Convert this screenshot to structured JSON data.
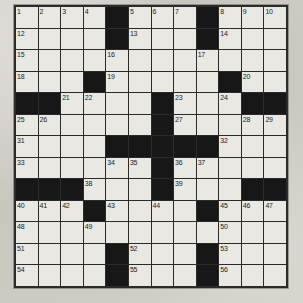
{
  "document": {
    "type": "crossword-puzzle-grid",
    "title": "Crossword Puzzle",
    "grid": {
      "columns": 12,
      "rows": 13,
      "total_cells": 156,
      "highest_clue_number": 56
    },
    "colors": {
      "paper_background": "#cfcbc3",
      "open_cell": "#e9e8e3",
      "block_cell": "#171717",
      "grid_line": "#2b2b2b",
      "number_text": "#1b1b1b"
    },
    "cells": [
      [
        {
          "block": false,
          "num": "1"
        },
        {
          "block": false,
          "num": "2"
        },
        {
          "block": false,
          "num": "3"
        },
        {
          "block": false,
          "num": "4"
        },
        {
          "block": true,
          "num": ""
        },
        {
          "block": false,
          "num": "5"
        },
        {
          "block": false,
          "num": "6"
        },
        {
          "block": false,
          "num": "7"
        },
        {
          "block": true,
          "num": ""
        },
        {
          "block": false,
          "num": "8"
        },
        {
          "block": false,
          "num": "9"
        },
        {
          "block": false,
          "num": "10"
        },
        {
          "block": false,
          "num": "11"
        }
      ],
      [
        {
          "block": false,
          "num": "12"
        },
        {
          "block": false,
          "num": ""
        },
        {
          "block": false,
          "num": ""
        },
        {
          "block": false,
          "num": ""
        },
        {
          "block": true,
          "num": ""
        },
        {
          "block": false,
          "num": "13"
        },
        {
          "block": false,
          "num": ""
        },
        {
          "block": false,
          "num": ""
        },
        {
          "block": true,
          "num": ""
        },
        {
          "block": false,
          "num": "14"
        },
        {
          "block": false,
          "num": ""
        },
        {
          "block": false,
          "num": ""
        }
      ],
      [
        {
          "block": false,
          "num": "15"
        },
        {
          "block": false,
          "num": ""
        },
        {
          "block": false,
          "num": ""
        },
        {
          "block": false,
          "num": ""
        },
        {
          "block": false,
          "num": "16"
        },
        {
          "block": false,
          "num": ""
        },
        {
          "block": false,
          "num": ""
        },
        {
          "block": false,
          "num": ""
        },
        {
          "block": false,
          "num": "17"
        },
        {
          "block": false,
          "num": ""
        },
        {
          "block": false,
          "num": ""
        },
        {
          "block": false,
          "num": ""
        }
      ],
      [
        {
          "block": false,
          "num": "18"
        },
        {
          "block": false,
          "num": ""
        },
        {
          "block": false,
          "num": ""
        },
        {
          "block": true,
          "num": ""
        },
        {
          "block": false,
          "num": "19"
        },
        {
          "block": false,
          "num": ""
        },
        {
          "block": false,
          "num": ""
        },
        {
          "block": false,
          "num": ""
        },
        {
          "block": false,
          "num": ""
        },
        {
          "block": true,
          "num": ""
        },
        {
          "block": false,
          "num": "20"
        },
        {
          "block": false,
          "num": ""
        },
        {
          "block": false,
          "num": ""
        }
      ],
      [
        {
          "block": true,
          "num": ""
        },
        {
          "block": true,
          "num": ""
        },
        {
          "block": false,
          "num": "21"
        },
        {
          "block": false,
          "num": "22"
        },
        {
          "block": false,
          "num": ""
        },
        {
          "block": false,
          "num": ""
        },
        {
          "block": true,
          "num": ""
        },
        {
          "block": false,
          "num": "23"
        },
        {
          "block": false,
          "num": ""
        },
        {
          "block": false,
          "num": "24"
        },
        {
          "block": true,
          "num": ""
        },
        {
          "block": true,
          "num": ""
        }
      ],
      [
        {
          "block": false,
          "num": "25"
        },
        {
          "block": false,
          "num": "26"
        },
        {
          "block": false,
          "num": ""
        },
        {
          "block": false,
          "num": ""
        },
        {
          "block": false,
          "num": ""
        },
        {
          "block": false,
          "num": ""
        },
        {
          "block": true,
          "num": ""
        },
        {
          "block": false,
          "num": "27"
        },
        {
          "block": false,
          "num": ""
        },
        {
          "block": false,
          "num": ""
        },
        {
          "block": false,
          "num": "28"
        },
        {
          "block": false,
          "num": "29"
        },
        {
          "block": false,
          "num": "30"
        }
      ],
      [
        {
          "block": false,
          "num": "31"
        },
        {
          "block": false,
          "num": ""
        },
        {
          "block": false,
          "num": ""
        },
        {
          "block": false,
          "num": ""
        },
        {
          "block": true,
          "num": ""
        },
        {
          "block": true,
          "num": ""
        },
        {
          "block": true,
          "num": ""
        },
        {
          "block": true,
          "num": ""
        },
        {
          "block": true,
          "num": ""
        },
        {
          "block": false,
          "num": "32"
        },
        {
          "block": false,
          "num": ""
        },
        {
          "block": false,
          "num": ""
        }
      ],
      [
        {
          "block": false,
          "num": "33"
        },
        {
          "block": false,
          "num": ""
        },
        {
          "block": false,
          "num": ""
        },
        {
          "block": false,
          "num": ""
        },
        {
          "block": false,
          "num": "34"
        },
        {
          "block": false,
          "num": "35"
        },
        {
          "block": true,
          "num": ""
        },
        {
          "block": false,
          "num": "36"
        },
        {
          "block": false,
          "num": "37"
        },
        {
          "block": false,
          "num": ""
        },
        {
          "block": false,
          "num": ""
        },
        {
          "block": false,
          "num": ""
        }
      ],
      [
        {
          "block": true,
          "num": ""
        },
        {
          "block": true,
          "num": ""
        },
        {
          "block": true,
          "num": ""
        },
        {
          "block": false,
          "num": "38"
        },
        {
          "block": false,
          "num": ""
        },
        {
          "block": false,
          "num": ""
        },
        {
          "block": true,
          "num": ""
        },
        {
          "block": false,
          "num": "39"
        },
        {
          "block": false,
          "num": ""
        },
        {
          "block": false,
          "num": ""
        },
        {
          "block": true,
          "num": ""
        },
        {
          "block": true,
          "num": ""
        }
      ],
      [
        {
          "block": false,
          "num": "40"
        },
        {
          "block": false,
          "num": "41"
        },
        {
          "block": false,
          "num": "42"
        },
        {
          "block": true,
          "num": ""
        },
        {
          "block": false,
          "num": "43"
        },
        {
          "block": false,
          "num": ""
        },
        {
          "block": false,
          "num": "44"
        },
        {
          "block": false,
          "num": ""
        },
        {
          "block": true,
          "num": ""
        },
        {
          "block": false,
          "num": "45"
        },
        {
          "block": false,
          "num": "46"
        },
        {
          "block": false,
          "num": "47"
        }
      ],
      [
        {
          "block": false,
          "num": "48"
        },
        {
          "block": false,
          "num": ""
        },
        {
          "block": false,
          "num": ""
        },
        {
          "block": false,
          "num": "49"
        },
        {
          "block": false,
          "num": ""
        },
        {
          "block": false,
          "num": ""
        },
        {
          "block": false,
          "num": ""
        },
        {
          "block": false,
          "num": ""
        },
        {
          "block": false,
          "num": ""
        },
        {
          "block": false,
          "num": "50"
        },
        {
          "block": false,
          "num": ""
        },
        {
          "block": false,
          "num": ""
        }
      ],
      [
        {
          "block": false,
          "num": "51"
        },
        {
          "block": false,
          "num": ""
        },
        {
          "block": false,
          "num": ""
        },
        {
          "block": false,
          "num": ""
        },
        {
          "block": true,
          "num": ""
        },
        {
          "block": false,
          "num": "52"
        },
        {
          "block": false,
          "num": ""
        },
        {
          "block": false,
          "num": ""
        },
        {
          "block": true,
          "num": ""
        },
        {
          "block": false,
          "num": "53"
        },
        {
          "block": false,
          "num": ""
        },
        {
          "block": false,
          "num": ""
        }
      ],
      [
        {
          "block": false,
          "num": "54"
        },
        {
          "block": false,
          "num": ""
        },
        {
          "block": false,
          "num": ""
        },
        {
          "block": false,
          "num": ""
        },
        {
          "block": true,
          "num": ""
        },
        {
          "block": false,
          "num": "55"
        },
        {
          "block": false,
          "num": ""
        },
        {
          "block": false,
          "num": ""
        },
        {
          "block": true,
          "num": ""
        },
        {
          "block": false,
          "num": "56"
        },
        {
          "block": false,
          "num": ""
        },
        {
          "block": false,
          "num": ""
        }
      ]
    ]
  }
}
